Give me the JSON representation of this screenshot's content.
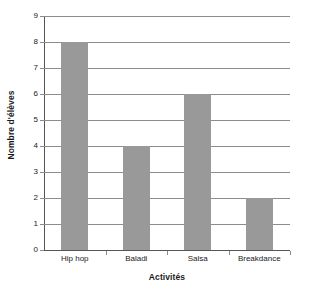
{
  "chart_data": {
    "type": "bar",
    "title": "",
    "xlabel": "Activités",
    "ylabel": "Nombre d'élèves",
    "categories": [
      "Hip hop",
      "Baladi",
      "Salsa",
      "Breakdance"
    ],
    "values": [
      8,
      4,
      6,
      2
    ],
    "series": [
      {
        "name": "Nombre d'élèves",
        "values": [
          8,
          4,
          6,
          2
        ]
      }
    ],
    "ylim": [
      0,
      9
    ],
    "y_ticks": [
      0,
      1,
      2,
      3,
      4,
      5,
      6,
      7,
      8,
      9
    ],
    "y_tick_labels": [
      "0",
      "1",
      "2",
      "3",
      "4",
      "5",
      "6",
      "7",
      "8",
      "9"
    ],
    "grid": true,
    "grid_axis": "y",
    "legend": false,
    "legend_position": "none",
    "bar_color": "#999999",
    "grid_color": "#8c8c8c",
    "axis_color": "#555555",
    "background_color": "#ffffff",
    "annotations": []
  }
}
